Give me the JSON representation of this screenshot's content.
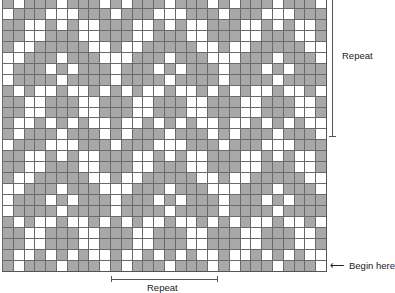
{
  "labels": {
    "vertical_repeat": "Repeat",
    "horizontal_repeat": "Repeat",
    "begin_here": "Begin here",
    "arrow_glyph": "⟵"
  },
  "colors": {
    "contrast": "#a8a8a8",
    "main": "#ffffff",
    "gridline": "#6a6a6a"
  },
  "grid": {
    "columns": 30,
    "rows": 25,
    "repeat_width_columns": 10,
    "repeat_height_rows": 12,
    "motif": [
      "GWGGGWGGGW",
      "WGGGWWWGGG",
      "GGWWGWGWWG",
      "GGWWGGGWWG",
      "GWWGGGGGWW",
      "WWGGGWGGGW",
      "WGGGWGWGGG",
      "WGGGGWGGGG",
      "GWGWWGWWGW",
      "GGWWGGGWWG",
      "GGWWGGGWWG",
      "GWWGWGWGWW"
    ]
  }
}
